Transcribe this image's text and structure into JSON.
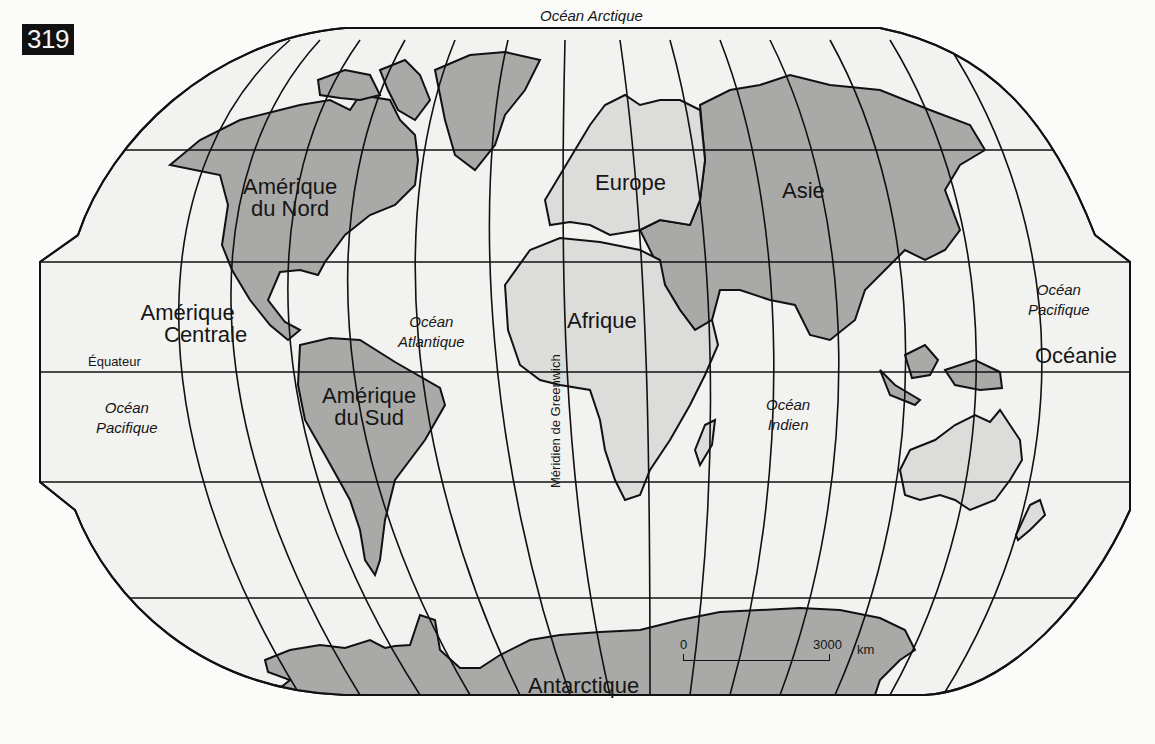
{
  "figure": {
    "number": "319"
  },
  "labels": {
    "continents": {
      "north_america": [
        "Amérique",
        "du Nord"
      ],
      "central_america": [
        "Amérique",
        "Centrale"
      ],
      "south_america": [
        "Amérique",
        "du Sud"
      ],
      "europe": "Europe",
      "africa": "Afrique",
      "asia": "Asie",
      "oceania": "Océanie",
      "antarctica": "Antarctique"
    },
    "oceans": {
      "arctic": "Océan Arctique",
      "atlantic": [
        "Océan",
        "Atlantique"
      ],
      "pacific_west": [
        "Océan",
        "Pacifique"
      ],
      "pacific_east": [
        "Océan",
        "Pacifique"
      ],
      "indian": [
        "Océan",
        "Indien"
      ]
    },
    "lines": {
      "equator": "Équateur",
      "greenwich": "Méridien de Greenwich"
    }
  },
  "scale": {
    "start": "0",
    "end": "3000",
    "unit": "km"
  },
  "colors": {
    "background": "#fbfbfa",
    "ocean": "#f2f2f0",
    "land_dark": "#a9a9a7",
    "land_light": "#dcdcda",
    "line": "#111111"
  }
}
